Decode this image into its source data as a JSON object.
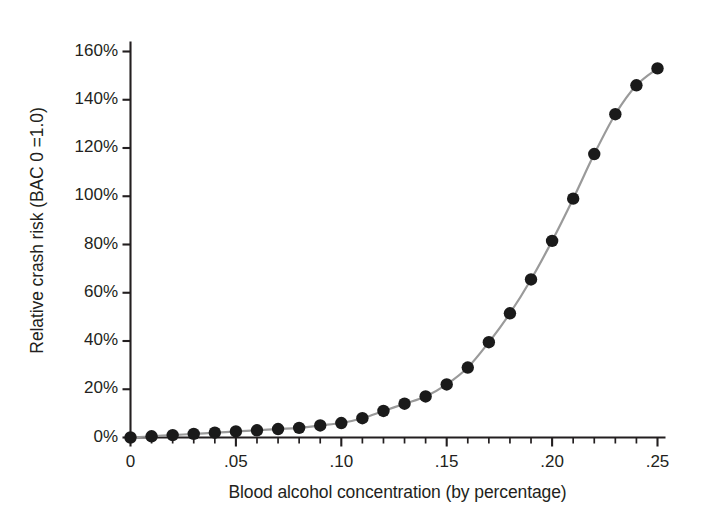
{
  "chart_data": {
    "type": "line",
    "title": "",
    "subtitle": "",
    "xlabel": "Blood alcohol concentration (by percentage)",
    "ylabel": "Relative crash risk (BAC 0 =1.0)",
    "xlim": [
      0,
      0.25
    ],
    "ylim": [
      0,
      160
    ],
    "grid": false,
    "legend": null,
    "legend_position": "none",
    "xtick_labels": [
      "0",
      ".05",
      ".10",
      ".15",
      ".20",
      ".25"
    ],
    "xtick_values": [
      0,
      0.05,
      0.1,
      0.15,
      0.2,
      0.25
    ],
    "xtick_minor_step": 0.01,
    "ytick_labels": [
      "0%",
      "20%",
      "40%",
      "60%",
      "80%",
      "100%",
      "120%",
      "140%",
      "160%"
    ],
    "ytick_values": [
      0,
      20,
      40,
      60,
      80,
      100,
      120,
      140,
      160
    ],
    "x": [
      0.0,
      0.01,
      0.02,
      0.03,
      0.04,
      0.05,
      0.06,
      0.07,
      0.08,
      0.09,
      0.1,
      0.11,
      0.12,
      0.13,
      0.14,
      0.15,
      0.16,
      0.17,
      0.18,
      0.19,
      0.2,
      0.21,
      0.22,
      0.23,
      0.24,
      0.25
    ],
    "values": [
      0,
      0.5,
      1,
      1.5,
      2,
      2.5,
      3,
      3.5,
      4,
      5,
      6,
      8,
      11,
      14,
      17,
      22,
      29,
      39.5,
      51.5,
      65.5,
      81.5,
      99,
      117.5,
      134,
      146,
      153
    ],
    "series": [
      {
        "name": "Relative crash risk",
        "marker": "filled-circle",
        "marker_color": "#1a1a1a",
        "line_color": "#9a9a9a",
        "values": [
          0,
          0.5,
          1,
          1.5,
          2,
          2.5,
          3,
          3.5,
          4,
          5,
          6,
          8,
          11,
          14,
          17,
          22,
          29,
          39.5,
          51.5,
          65.5,
          81.5,
          99,
          117.5,
          134,
          146,
          153
        ]
      }
    ],
    "annotations": []
  },
  "axes": {
    "y_axis_name": "relative-crash-risk-axis",
    "x_axis_name": "blood-alcohol-concentration-axis"
  },
  "colors": {
    "axis": "#231f20",
    "line": "#9a9a9a",
    "marker": "#1a1a1a",
    "text": "#231f20",
    "background": "#ffffff"
  }
}
